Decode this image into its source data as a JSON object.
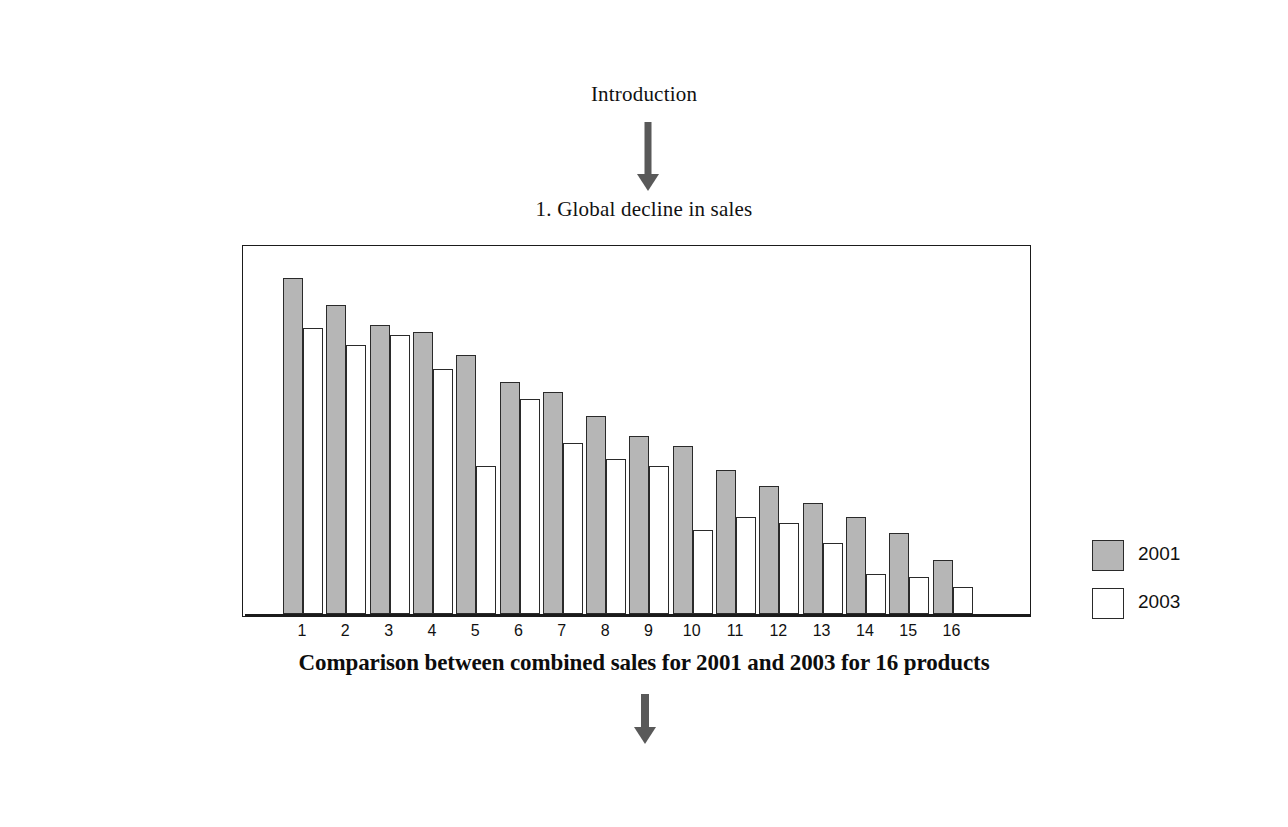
{
  "slide": {
    "intro_heading": "Introduction",
    "section_heading": "1. Global decline in sales",
    "arrow_top_name": "down-arrow",
    "arrow_bottom_name": "down-arrow"
  },
  "legend": {
    "entries": [
      {
        "label": "2001",
        "color": "#b6b6b6"
      },
      {
        "label": "2003",
        "color": "#ffffff"
      }
    ]
  },
  "caption": "Comparison between combined sales for 2001 and 2003 for 16 products",
  "chart_data": {
    "type": "bar",
    "title": "Comparison between combined sales for 2001 and 2003 for 16 products",
    "xlabel": "",
    "ylabel": "",
    "grid": false,
    "legend_position": "top-right",
    "axis_visible": {
      "x": true,
      "y": false
    },
    "ylim": [
      0,
      100
    ],
    "categories": [
      "1",
      "2",
      "3",
      "4",
      "5",
      "6",
      "7",
      "8",
      "9",
      "10",
      "11",
      "12",
      "13",
      "14",
      "15",
      "16"
    ],
    "series": [
      {
        "name": "2001",
        "color": "#b6b6b6",
        "values": [
          100,
          92,
          86,
          84,
          77,
          69,
          66,
          59,
          53,
          50,
          43,
          38,
          33,
          29,
          24,
          16
        ]
      },
      {
        "name": "2003",
        "color": "#ffffff",
        "values": [
          85,
          80,
          83,
          73,
          44,
          64,
          51,
          46,
          44,
          25,
          29,
          27,
          21,
          12,
          11,
          8
        ]
      }
    ]
  }
}
